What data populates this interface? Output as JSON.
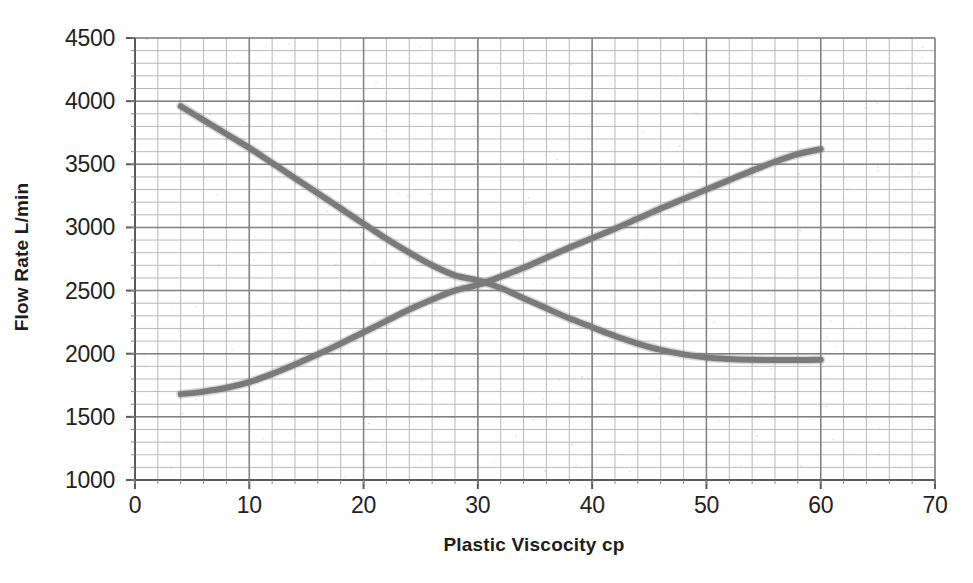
{
  "chart_data": {
    "type": "line",
    "title": "",
    "subtitle": "",
    "xlabel": "Plastic Viscocity cp",
    "ylabel": "Flow Rate L/min",
    "xlim": [
      0,
      70
    ],
    "ylim": [
      1000,
      4500
    ],
    "x_ticks": [
      0,
      10,
      20,
      30,
      40,
      50,
      60,
      70
    ],
    "y_ticks": [
      1000,
      1500,
      2000,
      2500,
      3000,
      3500,
      4000,
      4500
    ],
    "x_tick_labels": [
      "0",
      "10",
      "20",
      "30",
      "40",
      "50",
      "60",
      "70"
    ],
    "y_tick_labels": [
      "1000",
      "1500",
      "2000",
      "2500",
      "3000",
      "3500",
      "4000",
      "4500"
    ],
    "x_minor_step": 2,
    "y_minor_step": 100,
    "grid": true,
    "grid_major_color": "#808080",
    "grid_minor_color": "#b9b9b9",
    "legend": "none",
    "legend_position": "none",
    "line_color": "#7a7a7a",
    "line_width": 6,
    "annotations": [],
    "intersection": {
      "x": 31,
      "y": 2560
    },
    "series": [
      {
        "name": "descending-curve",
        "color": "#7a7a7a",
        "x": [
          4,
          6,
          8,
          10,
          12,
          14,
          16,
          18,
          20,
          22,
          24,
          26,
          28,
          30,
          32,
          34,
          36,
          38,
          40,
          42,
          44,
          46,
          48,
          50,
          52,
          54,
          56,
          58,
          60
        ],
        "y": [
          3960,
          3850,
          3740,
          3630,
          3510,
          3390,
          3270,
          3150,
          3030,
          2910,
          2800,
          2700,
          2620,
          2580,
          2520,
          2440,
          2360,
          2280,
          2210,
          2140,
          2080,
          2030,
          1995,
          1970,
          1958,
          1952,
          1950,
          1950,
          1952
        ]
      },
      {
        "name": "ascending-curve",
        "color": "#7a7a7a",
        "x": [
          4,
          6,
          8,
          10,
          12,
          14,
          16,
          18,
          20,
          22,
          24,
          26,
          28,
          30,
          32,
          34,
          36,
          38,
          40,
          42,
          44,
          46,
          48,
          50,
          52,
          54,
          56,
          58,
          60
        ],
        "y": [
          1680,
          1700,
          1730,
          1775,
          1840,
          1915,
          1995,
          2080,
          2170,
          2260,
          2350,
          2430,
          2500,
          2545,
          2610,
          2680,
          2760,
          2840,
          2915,
          2990,
          3070,
          3150,
          3225,
          3300,
          3375,
          3450,
          3520,
          3580,
          3620
        ]
      }
    ]
  },
  "axis": {
    "x_title": "Plastic Viscocity cp",
    "y_title": "Flow Rate L/min"
  }
}
